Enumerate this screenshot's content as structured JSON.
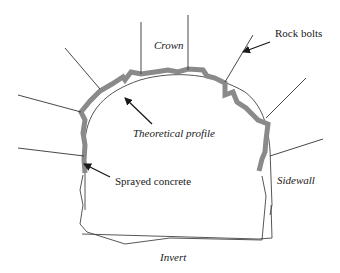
{
  "diagram": {
    "type": "tunnel-cross-section",
    "labels": {
      "crown": "Crown",
      "rock_bolts": "Rock bolts",
      "theoretical_profile": "Theoretical profile",
      "sprayed_concrete": "Sprayed concrete",
      "sidewall": "Sidewall",
      "invert": "Invert"
    },
    "colors": {
      "sprayed_concrete": "#888888",
      "lines": "#333333",
      "background": "#ffffff"
    }
  }
}
